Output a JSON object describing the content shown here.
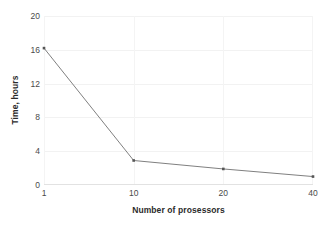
{
  "chart_data": {
    "type": "line",
    "title": "",
    "subtitle": "",
    "xlabel": "Number of prosessors",
    "ylabel": "Time, hours",
    "categories": [
      "1",
      "10",
      "20",
      "40"
    ],
    "x": [
      1,
      10,
      20,
      40
    ],
    "values": [
      16.2,
      2.9,
      1.9,
      1.0
    ],
    "series": [
      {
        "name": "Time",
        "values": [
          16.2,
          2.9,
          1.9,
          1.0
        ]
      }
    ],
    "x_tick_labels": [
      "1",
      "10",
      "20",
      "40"
    ],
    "y_tick_labels": [
      "0",
      "4",
      "8",
      "12",
      "16",
      "20"
    ],
    "y_ticks": [
      0,
      4,
      8,
      12,
      16,
      20
    ],
    "ylim": [
      0,
      20
    ],
    "x_axis_scale": "categorical",
    "grid": {
      "horizontal": true,
      "vertical": true,
      "color": "#f2f2f2"
    },
    "legend": {
      "visible": false,
      "position": "none",
      "entries": []
    },
    "annotations": [],
    "colors": {
      "line": "#808080",
      "marker": "#555555",
      "background": "#ffffff",
      "axis_text": "#4a4a4a",
      "axis_title_text": "#2b2b2b",
      "gridline": "#f2f2f2",
      "baseline": "#e2e2e2"
    },
    "marker": {
      "shape": "square",
      "size": 2.6
    }
  }
}
